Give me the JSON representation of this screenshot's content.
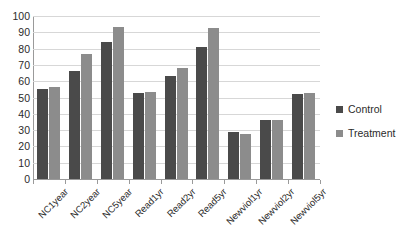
{
  "chart_data": {
    "type": "bar",
    "title": "",
    "xlabel": "",
    "ylabel": "",
    "ylim": [
      0,
      100
    ],
    "ytick_step": 10,
    "yticks": [
      100,
      90,
      80,
      70,
      60,
      50,
      40,
      30,
      20,
      10,
      0
    ],
    "grid": true,
    "legend_position": "right",
    "categories": [
      "NC1year",
      "NC2year",
      "NC5year",
      "Read1yr",
      "Read2yr",
      "Read5yr",
      "Newviol1yr",
      "Newviol2yr",
      "Newviol5yr"
    ],
    "series": [
      {
        "name": "Control",
        "color": "#4a4a4a",
        "values": [
          55.5,
          66,
          84,
          52.5,
          63,
          81,
          29,
          36.5,
          52
        ]
      },
      {
        "name": "Treatment",
        "color": "#8c8c8c",
        "values": [
          56.5,
          77,
          93,
          53.5,
          68,
          92.5,
          27.5,
          36,
          53
        ]
      }
    ]
  },
  "legend": {
    "items": [
      {
        "label": "Control",
        "swatch": "control"
      },
      {
        "label": "Treatment",
        "swatch": "treatment"
      }
    ]
  },
  "colors": {
    "control": "#4a4a4a",
    "treatment": "#8c8c8c",
    "gridline": "#d7d7d7",
    "axis": "#9a9a9a",
    "text": "#2b2b2b",
    "background": "#ffffff"
  }
}
